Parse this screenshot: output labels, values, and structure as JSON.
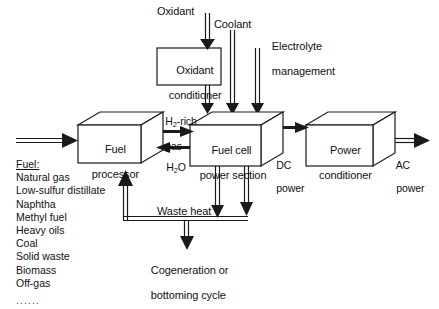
{
  "diagram": {
    "stroke_color": "#1a1a1a",
    "box_fill": "#ffffff",
    "blocks": [
      {
        "id": "oxidant-conditioner",
        "label_line1": "Oxidant",
        "label_line2": "conditioner",
        "shape": "rect"
      },
      {
        "id": "fuel-processor",
        "label_line1": "Fuel",
        "label_line2": "processor",
        "shape": "box3d"
      },
      {
        "id": "fuel-cell-power-section",
        "label_line1": "Fuel cell",
        "label_line2": "power section",
        "shape": "box3d"
      },
      {
        "id": "power-conditioner",
        "label_line1": "Power",
        "label_line2": "conditioner",
        "shape": "box3d"
      }
    ],
    "flow_labels": {
      "oxidant": "Oxidant",
      "coolant": "Coolant",
      "electrolyte_line1": "Electrolyte",
      "electrolyte_line2": "management",
      "h2_rich_line1_pre": "H",
      "h2_rich_line1_sub": "2",
      "h2_rich_line1_post": "-rich",
      "h2_rich_line2": "gas",
      "water_pre": "H",
      "water_sub": "2",
      "water_post": "O",
      "dc_power_line1": "DC",
      "dc_power_line2": "power",
      "ac_power_line1": "AC",
      "ac_power_line2": "power",
      "waste_heat": "Waste heat",
      "cogeneration_line1": "Cogeneration or",
      "cogeneration_line2": "bottoming cycle"
    },
    "fuel_input": {
      "heading": "Fuel:",
      "items": [
        "Natural gas",
        "Low-sulfur distillate",
        "Naphtha",
        "Methyl fuel",
        "Heavy oils",
        "Coal",
        "Solid waste",
        "Biomass",
        "Off-gas"
      ],
      "ellipsis": "......"
    }
  }
}
